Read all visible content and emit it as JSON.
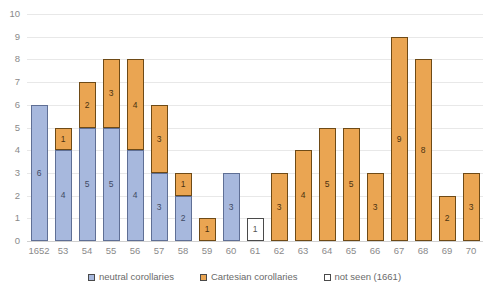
{
  "chart_data": {
    "type": "bar",
    "stacked": true,
    "title": "",
    "xlabel": "",
    "ylabel": "",
    "ylim": [
      0,
      10
    ],
    "yticks": [
      0,
      1,
      2,
      3,
      4,
      5,
      6,
      7,
      8,
      9,
      10
    ],
    "grid": true,
    "legend_position": "bottom",
    "categories": [
      "1652",
      "53",
      "54",
      "55",
      "56",
      "57",
      "58",
      "59",
      "60",
      "61",
      "62",
      "63",
      "64",
      "65",
      "66",
      "67",
      "68",
      "69",
      "70"
    ],
    "series": [
      {
        "name": "neutral corollaries",
        "color": "#a7b8dd",
        "values": [
          6,
          4,
          5,
          5,
          4,
          3,
          2,
          0,
          3,
          0,
          0,
          0,
          0,
          0,
          0,
          0,
          0,
          0,
          0
        ]
      },
      {
        "name": "Cartesian corollaries",
        "color": "#eaa552",
        "values": [
          0,
          1,
          2,
          3,
          4,
          3,
          1,
          1,
          0,
          0,
          3,
          4,
          5,
          5,
          3,
          9,
          8,
          2,
          3
        ]
      },
      {
        "name": "not seen (1661)",
        "color": "#ffffff",
        "values": [
          0,
          0,
          0,
          0,
          0,
          0,
          0,
          0,
          0,
          1,
          0,
          0,
          0,
          0,
          0,
          0,
          0,
          0,
          0
        ]
      }
    ],
    "totals": [
      6,
      5,
      7,
      8,
      8,
      6,
      3,
      1,
      3,
      1,
      3,
      4,
      5,
      5,
      3,
      9,
      8,
      2,
      3
    ]
  },
  "legend": {
    "items": [
      {
        "label": "neutral corollaries",
        "swatch": "neutral"
      },
      {
        "label": "Cartesian corollaries",
        "swatch": "cartesian"
      },
      {
        "label": "not seen (1661)",
        "swatch": "notseen"
      }
    ]
  }
}
